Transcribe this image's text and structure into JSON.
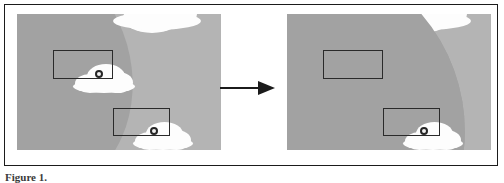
{
  "figure": {
    "caption_label": "Figure 1.",
    "caption_text": "",
    "arrow_name": "transformation-arrow",
    "colors": {
      "sky": "#b4b4b4",
      "shadow": "#a2a2a2",
      "cloud": "#fdfdfd",
      "bbox_stroke": "#2a2a2a",
      "marker_stroke": "#262626",
      "frame": "#1b1b1b",
      "background": "#ffffff"
    }
  },
  "panels": [
    {
      "id": "left",
      "name": "source-image-panel",
      "clouds": [
        {
          "name": "cloud-top",
          "has_marker": false,
          "occluded": false
        },
        {
          "name": "cloud-upper-detected",
          "has_marker": true,
          "occluded": false
        },
        {
          "name": "cloud-lower-detected",
          "has_marker": true,
          "occluded": false
        }
      ],
      "boxes": [
        {
          "name": "bbox-upper",
          "marker": true
        },
        {
          "name": "bbox-lower",
          "marker": true
        }
      ]
    },
    {
      "id": "right",
      "name": "result-image-panel",
      "clouds": [
        {
          "name": "cloud-top",
          "has_marker": false,
          "occluded": false
        },
        {
          "name": "cloud-upper-detected",
          "has_marker": false,
          "occluded": true
        },
        {
          "name": "cloud-lower-detected",
          "has_marker": true,
          "occluded": true
        }
      ],
      "boxes": [
        {
          "name": "bbox-upper",
          "marker": false
        },
        {
          "name": "bbox-lower",
          "marker": true
        }
      ]
    }
  ]
}
